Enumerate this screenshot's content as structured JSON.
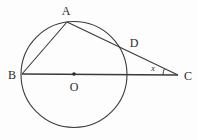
{
  "figure": {
    "kind": "circle-geometry-diagram",
    "width": 197,
    "height": 140,
    "background_color": "#fdfdfd",
    "stroke_color": "#3a3a3a",
    "label_color": "#2b2b2b",
    "faint_text_color": "#f2f2f2"
  },
  "labels": {
    "A": "A",
    "B": "B",
    "C": "C",
    "D": "D",
    "O": "O",
    "angle_x": "x"
  },
  "points": {
    "A": {
      "x": 67,
      "y": 22,
      "label_x": 66,
      "label_y": 11
    },
    "B": {
      "x": 22,
      "y": 74,
      "label_x": 12,
      "label_y": 75
    },
    "C": {
      "x": 178,
      "y": 75,
      "label_x": 188,
      "label_y": 76
    },
    "D": {
      "x": 124,
      "y": 50,
      "label_x": 134,
      "label_y": 43
    },
    "O": {
      "x": 74,
      "y": 74,
      "label_x": 74,
      "label_y": 87
    }
  },
  "circle": {
    "cx": 74,
    "cy": 74.5,
    "r": 53
  },
  "segments": [
    {
      "name": "BC",
      "from": "B",
      "to": "C"
    },
    {
      "name": "BA",
      "from": "B",
      "to": "A"
    },
    {
      "name": "AC",
      "from": "A",
      "to": "C"
    }
  ],
  "angle_marks": [
    {
      "name": "angle-x-at-C",
      "vertex": "C",
      "label": "x",
      "label_x": 153,
      "label_y": 69
    }
  ],
  "center_dot": {
    "x": 74,
    "y": 74,
    "r": 1.8
  },
  "faint_overlay_text": "…………"
}
